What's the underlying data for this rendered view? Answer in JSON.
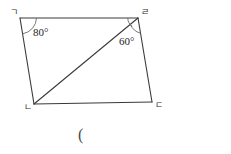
{
  "figure": {
    "type": "quadrilateral-with-diagonal",
    "stroke_color": "#3a3a3a",
    "arc_color": "#6b6b6b",
    "background_color": "#ffffff",
    "vertices": [
      {
        "key": "g",
        "label": "ㄱ",
        "x": 20,
        "y": 18
      },
      {
        "key": "r",
        "label": "ㄹ",
        "x": 138,
        "y": 18
      },
      {
        "key": "d",
        "label": "ㄷ",
        "x": 152,
        "y": 102
      },
      {
        "key": "n",
        "label": "ㄴ",
        "x": 34,
        "y": 104
      }
    ],
    "edges": [
      {
        "name": "edge-g-r",
        "from": "g",
        "to": "r"
      },
      {
        "name": "edge-r-d",
        "from": "r",
        "to": "d"
      },
      {
        "name": "edge-d-n",
        "from": "d",
        "to": "n"
      },
      {
        "name": "edge-n-g",
        "from": "n",
        "to": "g"
      }
    ],
    "diagonal": {
      "name": "diagonal-n-r",
      "from": "n",
      "to": "r"
    },
    "angles": [
      {
        "key": "g",
        "vertex": "g",
        "value": "80",
        "degree_symbol": "°",
        "text": "80°",
        "arc": true
      },
      {
        "key": "r",
        "vertex": "r",
        "value": "60",
        "degree_symbol": "°",
        "text": "60°",
        "arc": true
      },
      {
        "key": "r-upper",
        "vertex": "r",
        "value": "",
        "degree_symbol": "",
        "text": "",
        "arc": true
      }
    ]
  },
  "caption": {
    "text": "("
  }
}
